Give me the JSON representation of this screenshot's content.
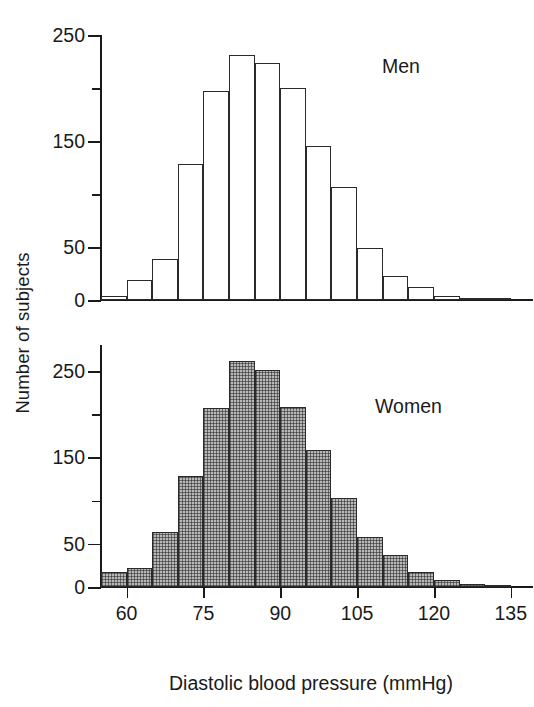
{
  "figure": {
    "ylabel": "Number of subjects",
    "xlabel": "Diastolic blood pressure (mmHg)"
  },
  "chart_data": {
    "type": "bar",
    "title": "",
    "subtitle": "",
    "xlabel": "Diastolic blood pressure (mmHg)",
    "ylabel": "Number of subjects",
    "grid": false,
    "legend_position": "inside-panel",
    "bin_width": 5,
    "bin_starts": [
      55,
      60,
      65,
      70,
      75,
      80,
      85,
      90,
      95,
      100,
      105,
      110,
      115,
      120,
      125,
      130
    ],
    "categories": [
      "55-60",
      "60-65",
      "65-70",
      "70-75",
      "75-80",
      "80-85",
      "85-90",
      "90-95",
      "95-100",
      "100-105",
      "105-110",
      "110-115",
      "115-120",
      "120-125",
      "125-130",
      "130-135"
    ],
    "panels": [
      {
        "name": "Men",
        "annotation": "Men",
        "fill": "white",
        "ylim": [
          0,
          250
        ],
        "yticks_major": [
          0,
          50,
          150,
          250
        ],
        "yticks_minor": [
          100,
          200
        ],
        "ytick_labels": [
          "0",
          "50",
          "150",
          "250"
        ],
        "values": [
          4,
          19,
          39,
          128,
          197,
          231,
          224,
          200,
          145,
          107,
          49,
          23,
          12,
          4,
          2,
          1
        ]
      },
      {
        "name": "Women",
        "annotation": "Women",
        "fill": "hatched-gray",
        "ylim": [
          0,
          280
        ],
        "yticks_major": [
          0,
          50,
          150,
          250
        ],
        "yticks_minor": [
          100,
          200
        ],
        "ytick_labels": [
          "0",
          "50",
          "150",
          "250"
        ],
        "values": [
          17,
          22,
          64,
          128,
          207,
          262,
          251,
          208,
          158,
          103,
          58,
          37,
          17,
          8,
          4,
          1
        ]
      }
    ],
    "x": {
      "ticks": [
        60,
        75,
        90,
        105,
        120,
        135
      ],
      "tick_labels": [
        "60",
        "75",
        "90",
        "105",
        "120",
        "135"
      ],
      "xlim": [
        55,
        137
      ]
    }
  }
}
